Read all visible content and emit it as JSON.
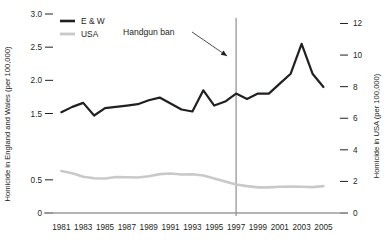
{
  "chart_data": {
    "type": "line",
    "title": "",
    "xlabel": "",
    "ylabel": "Homicide in England and Wales (per 100,000)",
    "y2label": "Homicide in USA (per 100,000)",
    "grid": false,
    "legend_position": "top-left",
    "x": [
      1981,
      1982,
      1983,
      1984,
      1985,
      1986,
      1987,
      1988,
      1989,
      1990,
      1991,
      1992,
      1993,
      1994,
      1995,
      1996,
      1997,
      1998,
      1999,
      2000,
      2001,
      2002,
      2003,
      2004,
      2005
    ],
    "xlim": [
      1980.6,
      2005.6
    ],
    "xtick_labels": [
      "1981",
      "1983",
      "1985",
      "1987",
      "1989",
      "1991",
      "1993",
      "1995",
      "1997",
      "1999",
      "2001",
      "2003",
      "2005"
    ],
    "xticks": [
      1981,
      1983,
      1985,
      1987,
      1989,
      1991,
      1993,
      1995,
      1997,
      1999,
      2001,
      2003,
      2005
    ],
    "ylim": [
      0,
      3.0
    ],
    "ytick_labels": [
      "3.0",
      "2.5",
      "2.0",
      "1.5",
      "",
      "0.5",
      "0"
    ],
    "yticks": [
      3.0,
      2.5,
      2.0,
      1.5,
      1.0,
      0.5,
      0
    ],
    "y2lim": [
      0,
      12.6
    ],
    "y2tick_labels": [
      "12",
      "10",
      "8",
      "6",
      "4",
      "2",
      "0"
    ],
    "y2ticks": [
      12,
      10,
      8,
      6,
      4,
      2,
      0
    ],
    "series": [
      {
        "name": "E & W",
        "axis": "left",
        "color": "#231f20",
        "values": [
          1.52,
          1.6,
          1.66,
          1.47,
          1.58,
          1.6,
          1.62,
          1.64,
          1.7,
          1.74,
          1.65,
          1.56,
          1.53,
          1.85,
          1.62,
          1.68,
          1.8,
          1.72,
          1.8,
          1.8,
          1.95,
          2.1,
          2.55,
          2.1,
          1.9
        ]
      },
      {
        "name": "USA",
        "axis": "right",
        "color": "#c9cac8",
        "values": [
          2.66,
          2.52,
          2.3,
          2.2,
          2.18,
          2.28,
          2.26,
          2.25,
          2.33,
          2.46,
          2.5,
          2.44,
          2.45,
          2.37,
          2.18,
          2.0,
          1.8,
          1.7,
          1.62,
          1.62,
          1.66,
          1.67,
          1.66,
          1.64,
          1.7
        ]
      }
    ],
    "annotations": [
      {
        "name": "handgun-ban",
        "label": "Handgun ban",
        "x": 1997,
        "vline": true,
        "vline_color": "#8d8f8c"
      }
    ],
    "legend": [
      {
        "label": "E & W",
        "color": "#231f20"
      },
      {
        "label": "USA",
        "color": "#c9cac8"
      }
    ]
  }
}
